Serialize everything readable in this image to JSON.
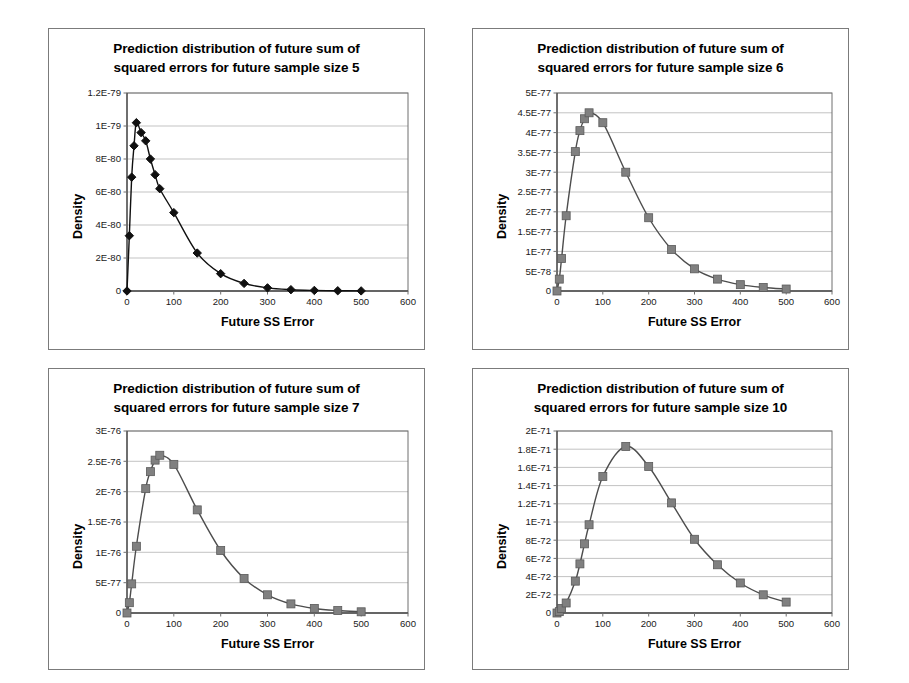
{
  "page": {
    "background": "#ffffff",
    "panel_border_color": "#7b7b7b"
  },
  "panels": [
    {
      "name": "chart-panel-size-5",
      "title_line1": "Prediction distribution of future sum of",
      "title_line2": "squared errors for future sample size 5"
    },
    {
      "name": "chart-panel-size-6",
      "title_line1": "Prediction distribution of future sum of",
      "title_line2": "squared errors for future sample size 6"
    },
    {
      "name": "chart-panel-size-7",
      "title_line1": "Prediction distribution of future sum of",
      "title_line2": "squared errors for future sample size 7"
    },
    {
      "name": "chart-panel-size-10",
      "title_line1": "Prediction distribution of future sum of",
      "title_line2": "squared errors for future sample size 10"
    }
  ],
  "chart_data": [
    {
      "id": "size5",
      "type": "line",
      "title": "Prediction distribution of future sum of squared errors for future sample size 5",
      "xlabel": "Future SS Error",
      "ylabel": "Density",
      "xlim": [
        0,
        600
      ],
      "ylim": [
        0,
        1.2e-79
      ],
      "xticks": [
        0,
        100,
        200,
        300,
        400,
        500,
        600
      ],
      "xticklabels": [
        "0",
        "100",
        "200",
        "300",
        "400",
        "500",
        "600"
      ],
      "yticks": [
        0,
        2e-80,
        4e-80,
        6e-80,
        8e-80,
        1e-79,
        1.2e-79
      ],
      "yticklabels": [
        "0",
        "2E-80",
        "4E-80",
        "6E-80",
        "8E-80",
        "1E-79",
        "1.2E-79"
      ],
      "grid": true,
      "marker": "diamond",
      "marker_color": "#101010",
      "line_color": "#101010",
      "x": [
        0,
        5,
        10,
        15,
        20,
        30,
        40,
        50,
        60,
        70,
        100,
        150,
        200,
        250,
        300,
        350,
        400,
        450,
        500
      ],
      "values": [
        0,
        3.35e-80,
        6.9e-80,
        8.8e-80,
        1.02e-79,
        9.6e-80,
        9.1e-80,
        8e-80,
        7.05e-80,
        6.2e-80,
        4.75e-80,
        2.3e-80,
        1.05e-80,
        4.6e-81,
        1.9e-81,
        8e-82,
        3.5e-82,
        1.5e-82,
        6e-83
      ]
    },
    {
      "id": "size6",
      "type": "line",
      "title": "Prediction distribution of future sum of squared errors for future sample size 6",
      "xlabel": "Future SS Error",
      "ylabel": "Density",
      "xlim": [
        0,
        600
      ],
      "ylim": [
        0,
        5e-77
      ],
      "xticks": [
        0,
        100,
        200,
        300,
        400,
        500,
        600
      ],
      "xticklabels": [
        "0",
        "100",
        "200",
        "300",
        "400",
        "500",
        "600"
      ],
      "yticks": [
        0,
        5e-78,
        1e-77,
        1.5e-77,
        2e-77,
        2.5e-77,
        3e-77,
        3.5e-77,
        4e-77,
        4.5e-77,
        5e-77
      ],
      "yticklabels": [
        "0",
        "5E-78",
        "1E-77",
        "1.5E-77",
        "2E-77",
        "2.5E-77",
        "3E-77",
        "3.5E-77",
        "4E-77",
        "4.5E-77",
        "5E-77"
      ],
      "grid": true,
      "marker": "square",
      "marker_color": "#808080",
      "line_color": "#4d4d4d",
      "x": [
        0,
        5,
        10,
        20,
        40,
        50,
        60,
        70,
        100,
        150,
        200,
        250,
        300,
        350,
        400,
        450,
        500
      ],
      "values": [
        0,
        3e-78,
        8.2e-78,
        1.9e-77,
        3.52e-77,
        4.05e-77,
        4.35e-77,
        4.5e-77,
        4.25e-77,
        3e-77,
        1.85e-77,
        1.05e-77,
        5.6e-78,
        3e-78,
        1.6e-78,
        9e-79,
        5e-79
      ]
    },
    {
      "id": "size7",
      "type": "line",
      "title": "Prediction distribution of future sum of squared errors for future sample size 7",
      "xlabel": "Future SS Error",
      "ylabel": "Density",
      "xlim": [
        0,
        600
      ],
      "ylim": [
        0,
        3e-76
      ],
      "xticks": [
        0,
        100,
        200,
        300,
        400,
        500,
        600
      ],
      "xticklabels": [
        "0",
        "100",
        "200",
        "300",
        "400",
        "500",
        "600"
      ],
      "yticks": [
        0,
        5e-77,
        1e-76,
        1.5e-76,
        2e-76,
        2.5e-76,
        3e-76
      ],
      "yticklabels": [
        "0",
        "5E-77",
        "1E-76",
        "1.5E-76",
        "2E-76",
        "2.5E-76",
        "3E-76"
      ],
      "grid": true,
      "marker": "square",
      "marker_color": "#808080",
      "line_color": "#4d4d4d",
      "x": [
        0,
        5,
        10,
        20,
        40,
        50,
        60,
        70,
        100,
        150,
        200,
        250,
        300,
        350,
        400,
        450,
        500
      ],
      "values": [
        0,
        1.7e-77,
        4.8e-77,
        1.1e-76,
        2.05e-76,
        2.33e-76,
        2.52e-76,
        2.6e-76,
        2.45e-76,
        1.7e-76,
        1.03e-76,
        5.7e-77,
        3e-77,
        1.5e-77,
        7.5e-78,
        4e-78,
        2e-78
      ]
    },
    {
      "id": "size10",
      "type": "line",
      "title": "Prediction distribution of future sum of squared errors for future sample size 10",
      "xlabel": "Future SS Error",
      "ylabel": "Density",
      "xlim": [
        0,
        600
      ],
      "ylim": [
        0,
        2e-71
      ],
      "xticks": [
        0,
        100,
        200,
        300,
        400,
        500,
        600
      ],
      "xticklabels": [
        "0",
        "100",
        "200",
        "300",
        "400",
        "500",
        "600"
      ],
      "yticks": [
        0,
        2e-72,
        4e-72,
        6e-72,
        8e-72,
        1e-71,
        1.2e-71,
        1.4e-71,
        1.6e-71,
        1.8e-71,
        2e-71
      ],
      "yticklabels": [
        "0",
        "2E-72",
        "4E-72",
        "6E-72",
        "8E-72",
        "1E-71",
        "1.2E-71",
        "1.4E-71",
        "1.6E-71",
        "1.8E-71",
        "2E-71"
      ],
      "grid": true,
      "marker": "square",
      "marker_color": "#808080",
      "line_color": "#4d4d4d",
      "x": [
        0,
        5,
        10,
        20,
        40,
        50,
        60,
        70,
        100,
        150,
        200,
        250,
        300,
        350,
        400,
        450,
        500
      ],
      "values": [
        0,
        1.5e-73,
        5e-73,
        1.1e-72,
        3.5e-72,
        5.4e-72,
        7.6e-72,
        9.7e-72,
        1.5e-71,
        1.83e-71,
        1.61e-71,
        1.21e-71,
        8.1e-72,
        5.3e-72,
        3.3e-72,
        2e-72,
        1.2e-72
      ]
    }
  ]
}
